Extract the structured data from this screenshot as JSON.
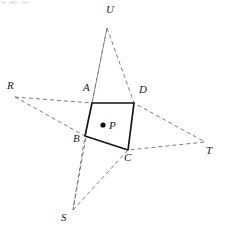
{
  "figure": {
    "type": "geometry-diagram",
    "width": 225,
    "height": 240,
    "colors": {
      "background": "#ffffff",
      "solid_stroke": "#141414",
      "dashed_stroke": "#6e6e6e",
      "label_color": "#1a1a1a",
      "point_fill": "#0d0d0d"
    },
    "points": {
      "A": {
        "label": "A",
        "x": 92,
        "y": 103,
        "label_x": 83,
        "label_y": 89,
        "kind": "quad-vertex"
      },
      "B": {
        "label": "B",
        "x": 85,
        "y": 136,
        "label_x": 73,
        "label_y": 140,
        "kind": "quad-vertex"
      },
      "C": {
        "label": "C",
        "x": 128,
        "y": 150,
        "label_x": 124,
        "label_y": 157,
        "kind": "quad-vertex"
      },
      "D": {
        "label": "D",
        "x": 134,
        "y": 103,
        "label_x": 139,
        "label_y": 90,
        "kind": "quad-vertex"
      },
      "P": {
        "label": "P",
        "x": 103,
        "y": 125,
        "label_x": 109,
        "label_y": 120,
        "kind": "interior-point"
      },
      "R": {
        "label": "R",
        "x": 15,
        "y": 97,
        "label_x": 7,
        "label_y": 84,
        "kind": "exterior-point"
      },
      "S": {
        "label": "S",
        "x": 73,
        "y": 210,
        "label_x": 61,
        "label_y": 214,
        "kind": "exterior-point"
      },
      "T": {
        "label": "T",
        "x": 205,
        "y": 142,
        "label_x": 206,
        "label_y": 146,
        "kind": "exterior-point"
      },
      "U": {
        "label": "U",
        "x": 107,
        "y": 28,
        "label_x": 106,
        "label_y": 5,
        "kind": "exterior-point"
      }
    },
    "quadrilateral": {
      "name": "ABCD",
      "path": "M 92 103 L 134 103 L 128 150 L 85 136 Z",
      "edges": [
        "AD",
        "DC",
        "CB",
        "BA"
      ]
    },
    "dashed_rays": [
      {
        "name": "R-A",
        "from": "R",
        "through": "A",
        "to": "S",
        "path": "M 15 97 L 92 103 L 107 28"
      },
      {
        "name": "R-B",
        "from": "R",
        "through": "B",
        "to": "S",
        "path": "M 15 97 L 85 136 L 73 210"
      },
      {
        "name": "U-A-S",
        "from": "U",
        "through": "A",
        "to": "S",
        "path": "M 107 28 L 92 103 L 73 210"
      },
      {
        "name": "U-D-T",
        "from": "U",
        "through": "D",
        "to": "T",
        "path": "M 107 28 L 134 103 L 205 142"
      },
      {
        "name": "S-C-T",
        "from": "S",
        "through": "C",
        "to": "T",
        "path": "M 73 210 L 128 150 L 205 142"
      },
      {
        "name": "C-T",
        "from": "C",
        "through": "C",
        "to": "T",
        "path": "M 128 150 L 205 142"
      }
    ],
    "point_marker_radius": 2.6
  }
}
